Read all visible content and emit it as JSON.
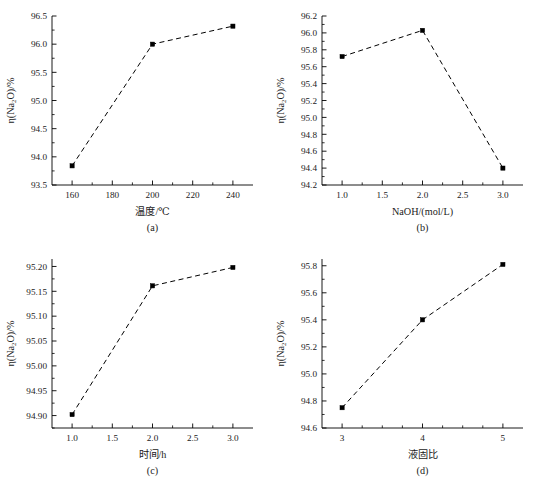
{
  "figure": {
    "background_color": "#ffffff",
    "line_color": "#000000",
    "marker_color": "#000000",
    "marker_shape": "square",
    "line_style": "dashed",
    "shared_ylabel": "η(Na₂O)/%"
  },
  "chart_data": [
    {
      "id": "a",
      "type": "line",
      "caption": "(a)",
      "title": "",
      "xlabel": "温度/℃",
      "ylabel": "η(Na₂O)/%",
      "ylabel_parts": {
        "eta": "η(Na",
        "sub": "2",
        "tail": "O)/%"
      },
      "x": [
        160,
        200,
        240
      ],
      "values": [
        93.84,
        96.0,
        96.32
      ],
      "xlim": [
        150,
        250
      ],
      "ylim": [
        93.5,
        96.5
      ],
      "xticks": [
        160,
        180,
        200,
        220,
        240
      ],
      "xticklabels": [
        "160",
        "180",
        "200",
        "220",
        "240"
      ],
      "yticks": [
        93.5,
        94.0,
        94.5,
        95.0,
        95.5,
        96.0,
        96.5
      ],
      "yticklabels": [
        "93.5",
        "94.0",
        "94.5",
        "95.0",
        "95.5",
        "96.0",
        "96.5"
      ],
      "x_minor_count": 1,
      "y_minor_count": 1,
      "grid": false,
      "legend": false
    },
    {
      "id": "b",
      "type": "line",
      "caption": "(b)",
      "title": "",
      "xlabel": "NaOH/(mol/L)",
      "ylabel": "η(Na₂O)/%",
      "ylabel_parts": {
        "eta": "η(Na",
        "sub": "2",
        "tail": "O)/%"
      },
      "x": [
        1.0,
        2.0,
        3.0
      ],
      "values": [
        95.72,
        96.03,
        94.4
      ],
      "xlim": [
        0.75,
        3.25
      ],
      "ylim": [
        94.2,
        96.2
      ],
      "xticks": [
        1.0,
        1.5,
        2.0,
        2.5,
        3.0
      ],
      "xticklabels": [
        "1.0",
        "1.5",
        "2.0",
        "2.5",
        "3.0"
      ],
      "yticks": [
        94.2,
        94.4,
        94.6,
        94.8,
        95.0,
        95.2,
        95.4,
        95.6,
        95.8,
        96.0,
        96.2
      ],
      "yticklabels": [
        "94.2",
        "94.4",
        "94.6",
        "94.8",
        "95.0",
        "95.2",
        "95.4",
        "95.6",
        "95.8",
        "96.0",
        "96.2"
      ],
      "x_minor_count": 1,
      "y_minor_count": 1,
      "grid": false,
      "legend": false
    },
    {
      "id": "c",
      "type": "line",
      "caption": "(c)",
      "title": "",
      "xlabel": "时间/h",
      "ylabel": "η(Na₂O)/%",
      "ylabel_parts": {
        "eta": "η(Na",
        "sub": "2",
        "tail": "O)/%"
      },
      "x": [
        1.0,
        2.0,
        3.0
      ],
      "values": [
        94.902,
        95.161,
        95.198
      ],
      "xlim": [
        0.75,
        3.25
      ],
      "ylim": [
        94.875,
        95.215
      ],
      "xticks": [
        1.0,
        1.5,
        2.0,
        2.5,
        3.0
      ],
      "xticklabels": [
        "1.0",
        "1.5",
        "2.0",
        "2.5",
        "3.0"
      ],
      "yticks": [
        94.9,
        94.95,
        95.0,
        95.05,
        95.1,
        95.15,
        95.2
      ],
      "yticklabels": [
        "94.90",
        "94.95",
        "95.00",
        "95.05",
        "95.10",
        "95.15",
        "95.20"
      ],
      "x_minor_count": 1,
      "y_minor_count": 1,
      "grid": false,
      "legend": false
    },
    {
      "id": "d",
      "type": "line",
      "caption": "(d)",
      "title": "",
      "xlabel": "液固比",
      "ylabel": "η(Na₂O)/%",
      "ylabel_parts": {
        "eta": "η(Na",
        "sub": "2",
        "tail": "O)/%"
      },
      "x": [
        3,
        4,
        5
      ],
      "values": [
        94.75,
        95.4,
        95.81
      ],
      "xlim": [
        2.75,
        5.25
      ],
      "ylim": [
        94.6,
        95.85
      ],
      "xticks": [
        3,
        4,
        5
      ],
      "xticklabels": [
        "3",
        "4",
        "5"
      ],
      "yticks": [
        94.6,
        94.8,
        95.0,
        95.2,
        95.4,
        95.6,
        95.8
      ],
      "yticklabels": [
        "94.6",
        "94.8",
        "95.0",
        "95.2",
        "95.4",
        "95.6",
        "95.8"
      ],
      "x_minor_count": 3,
      "y_minor_count": 1,
      "grid": false,
      "legend": false
    }
  ]
}
